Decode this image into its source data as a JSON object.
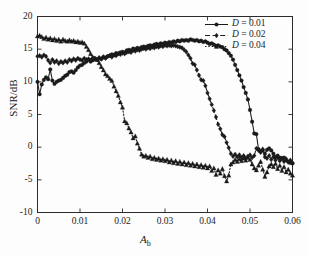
{
  "chart_data": {
    "type": "line",
    "title": "",
    "xlabel": "A_b",
    "xlabel_main": "A",
    "xlabel_sub": "b",
    "ylabel": "SNR/dB",
    "xlim": [
      0,
      0.06
    ],
    "ylim": [
      -10,
      20
    ],
    "xticks": [
      "0",
      "0.01",
      "0.02",
      "0.03",
      "0.04",
      "0.05",
      "0.06"
    ],
    "xtick_values": [
      0,
      0.01,
      0.02,
      0.03,
      0.04,
      0.05,
      0.06
    ],
    "yticks": [
      "20",
      "15",
      "10",
      "5",
      "0",
      "-5",
      "-10"
    ],
    "ytick_values": [
      20,
      15,
      10,
      5,
      0,
      -5,
      -10
    ],
    "grid": false,
    "legend_position": "top-right",
    "legend": [
      "D = 0.01",
      "D = 0.02",
      "D = 0.04"
    ],
    "series": [
      {
        "name": "D = 0.01",
        "label_var": "D",
        "label_eq": " = 0.01",
        "color": "#1a1a1a",
        "linestyle": "solid",
        "marker": "circle",
        "x": [
          0.0,
          0.0005,
          0.001,
          0.0015,
          0.002,
          0.0025,
          0.003,
          0.0035,
          0.004,
          0.0045,
          0.005,
          0.0055,
          0.006,
          0.0065,
          0.007,
          0.0075,
          0.008,
          0.0085,
          0.009,
          0.0095,
          0.01,
          0.0105,
          0.011,
          0.0115,
          0.012,
          0.0125,
          0.013,
          0.0135,
          0.014,
          0.0145,
          0.015,
          0.0155,
          0.016,
          0.0165,
          0.017,
          0.0175,
          0.018,
          0.0185,
          0.019,
          0.0195,
          0.02,
          0.0205,
          0.021,
          0.0215,
          0.022,
          0.0225,
          0.023,
          0.0235,
          0.024,
          0.0245,
          0.025,
          0.0255,
          0.026,
          0.0265,
          0.027,
          0.0275,
          0.028,
          0.0285,
          0.029,
          0.0295,
          0.03,
          0.0305,
          0.031,
          0.0315,
          0.032,
          0.0325,
          0.033,
          0.0335,
          0.034,
          0.0345,
          0.035,
          0.0355,
          0.036,
          0.0365,
          0.037,
          0.0375,
          0.038,
          0.0385,
          0.039,
          0.0395,
          0.04,
          0.0405,
          0.041,
          0.0415,
          0.042,
          0.0425,
          0.043,
          0.0435,
          0.044,
          0.0445,
          0.045,
          0.0455,
          0.046,
          0.0465,
          0.047,
          0.0475,
          0.048,
          0.0485,
          0.049,
          0.0495,
          0.05,
          0.0505,
          0.051,
          0.0515,
          0.052,
          0.0525,
          0.053,
          0.0535,
          0.054,
          0.0545,
          0.055,
          0.0555,
          0.056,
          0.0565,
          0.057,
          0.0575,
          0.058,
          0.0585,
          0.059,
          0.0595,
          0.06
        ],
        "y": [
          10.0,
          8.1,
          9.6,
          10.3,
          10.7,
          10.4,
          11.9,
          10.2,
          9.7,
          10.0,
          10.2,
          10.3,
          10.6,
          10.9,
          11.1,
          11.5,
          11.6,
          11.4,
          11.8,
          12.2,
          12.5,
          12.6,
          12.9,
          13.1,
          13.4,
          13.1,
          13.3,
          13.6,
          13.4,
          13.6,
          13.5,
          13.8,
          13.7,
          13.9,
          14.0,
          14.2,
          14.1,
          14.4,
          14.3,
          14.5,
          14.6,
          14.5,
          14.8,
          14.9,
          14.8,
          15.1,
          15.0,
          15.2,
          15.1,
          15.3,
          15.4,
          15.3,
          15.5,
          15.6,
          15.5,
          15.7,
          15.8,
          15.7,
          15.9,
          15.8,
          16.0,
          15.9,
          16.1,
          16.0,
          16.2,
          16.1,
          16.3,
          16.2,
          16.4,
          16.3,
          16.4,
          16.3,
          16.5,
          16.4,
          16.3,
          16.4,
          16.2,
          16.3,
          16.1,
          16.2,
          16.0,
          15.8,
          15.9,
          15.7,
          15.5,
          15.6,
          15.4,
          15.3,
          15.0,
          14.8,
          14.4,
          14.0,
          13.4,
          12.6,
          11.8,
          11.0,
          10.2,
          9.2,
          8.3,
          7.3,
          5.7,
          3.9,
          2.1,
          2.0,
          -0.3,
          -0.6,
          -0.5,
          -1.0,
          -0.4,
          -0.2,
          -0.5,
          -1.0,
          -1.5,
          -1.3,
          -1.6,
          -1.8,
          -1.6,
          -2.0,
          -2.2,
          -2.4,
          -2.5
        ]
      },
      {
        "name": "D = 0.02",
        "label_var": "D",
        "label_eq": " = 0.02",
        "color": "#1a1a1a",
        "linestyle": "dashed",
        "marker": "diamond",
        "x": [
          0.0,
          0.0005,
          0.001,
          0.0015,
          0.002,
          0.0025,
          0.003,
          0.0035,
          0.004,
          0.0045,
          0.005,
          0.0055,
          0.006,
          0.0065,
          0.007,
          0.0075,
          0.008,
          0.0085,
          0.009,
          0.0095,
          0.01,
          0.0105,
          0.011,
          0.0115,
          0.012,
          0.0125,
          0.013,
          0.0135,
          0.014,
          0.0145,
          0.015,
          0.0155,
          0.016,
          0.0165,
          0.017,
          0.0175,
          0.018,
          0.0185,
          0.019,
          0.0195,
          0.02,
          0.0205,
          0.021,
          0.0215,
          0.022,
          0.0225,
          0.023,
          0.0235,
          0.024,
          0.0245,
          0.025,
          0.0255,
          0.026,
          0.0265,
          0.027,
          0.0275,
          0.028,
          0.0285,
          0.029,
          0.0295,
          0.03,
          0.0305,
          0.031,
          0.0315,
          0.032,
          0.0325,
          0.033,
          0.0335,
          0.034,
          0.0345,
          0.035,
          0.0355,
          0.036,
          0.0365,
          0.037,
          0.0375,
          0.038,
          0.0385,
          0.039,
          0.0395,
          0.04,
          0.0405,
          0.041,
          0.0415,
          0.042,
          0.0425,
          0.043,
          0.0435,
          0.044,
          0.0445,
          0.045,
          0.0455,
          0.046,
          0.0465,
          0.047,
          0.0475,
          0.048,
          0.0485,
          0.049,
          0.0495,
          0.05,
          0.0505,
          0.051,
          0.0515,
          0.052,
          0.0525,
          0.053,
          0.0535,
          0.054,
          0.0545,
          0.055,
          0.0555,
          0.056,
          0.0565,
          0.057,
          0.0575,
          0.058,
          0.0585,
          0.059,
          0.0595,
          0.06
        ],
        "y": [
          13.9,
          14.0,
          13.8,
          14.1,
          13.9,
          13.3,
          12.9,
          13.4,
          13.0,
          13.2,
          12.8,
          13.1,
          12.9,
          13.2,
          13.0,
          13.4,
          13.2,
          13.5,
          13.3,
          13.6,
          13.4,
          13.3,
          13.6,
          13.4,
          13.5,
          13.3,
          13.6,
          13.5,
          13.4,
          13.7,
          13.5,
          13.8,
          13.6,
          13.9,
          14.0,
          13.8,
          14.1,
          14.0,
          14.3,
          14.2,
          14.4,
          14.3,
          14.5,
          14.6,
          14.5,
          14.8,
          14.7,
          14.9,
          14.8,
          15.0,
          15.1,
          15.0,
          15.2,
          15.1,
          15.3,
          15.2,
          15.4,
          15.3,
          15.5,
          15.4,
          15.6,
          15.5,
          15.6,
          15.5,
          15.6,
          15.5,
          15.4,
          15.3,
          15.2,
          14.9,
          14.6,
          14.1,
          13.6,
          12.8,
          12.6,
          11.8,
          11.0,
          10.3,
          10.2,
          9.4,
          8.3,
          7.4,
          6.5,
          5.6,
          4.6,
          3.5,
          2.8,
          1.9,
          1.6,
          0.7,
          -0.1,
          -1.0,
          -1.4,
          -1.1,
          -1.5,
          -1.2,
          -1.6,
          -1.3,
          -1.7,
          -1.4,
          -1.2,
          -1.6,
          -1.3,
          -0.2,
          -0.5,
          -0.8,
          -0.3,
          -1.5,
          -1.7,
          -1.3,
          -1.9,
          -1.5,
          -2.0,
          -1.6,
          -2.1,
          -1.7,
          -2.2,
          -1.8,
          -2.3,
          -2.0,
          -2.4
        ]
      },
      {
        "name": "D = 0.04",
        "label_var": "D",
        "label_eq": " = 0.04",
        "color": "#1a1a1a",
        "linestyle": "dotted",
        "marker": "triangle",
        "x": [
          0.0,
          0.0005,
          0.001,
          0.0015,
          0.002,
          0.0025,
          0.003,
          0.0035,
          0.004,
          0.0045,
          0.005,
          0.0055,
          0.006,
          0.0065,
          0.007,
          0.0075,
          0.008,
          0.0085,
          0.009,
          0.0095,
          0.01,
          0.0105,
          0.011,
          0.0115,
          0.012,
          0.0125,
          0.013,
          0.0135,
          0.014,
          0.0145,
          0.015,
          0.0155,
          0.016,
          0.0165,
          0.017,
          0.0175,
          0.018,
          0.0185,
          0.019,
          0.0195,
          0.02,
          0.0205,
          0.021,
          0.0215,
          0.022,
          0.0225,
          0.023,
          0.0235,
          0.024,
          0.0245,
          0.025,
          0.0255,
          0.026,
          0.0265,
          0.027,
          0.0275,
          0.028,
          0.0285,
          0.029,
          0.0295,
          0.03,
          0.0305,
          0.031,
          0.0315,
          0.032,
          0.0325,
          0.033,
          0.0335,
          0.034,
          0.0345,
          0.035,
          0.0355,
          0.036,
          0.0365,
          0.037,
          0.0375,
          0.038,
          0.0385,
          0.039,
          0.0395,
          0.04,
          0.0405,
          0.041,
          0.0415,
          0.042,
          0.0425,
          0.043,
          0.0435,
          0.044,
          0.0445,
          0.045,
          0.0455,
          0.046,
          0.0465,
          0.047,
          0.0475,
          0.048,
          0.0485,
          0.049,
          0.0495,
          0.05,
          0.0505,
          0.051,
          0.0515,
          0.052,
          0.0525,
          0.053,
          0.0535,
          0.054,
          0.0545,
          0.055,
          0.0555,
          0.056,
          0.0565,
          0.057,
          0.0575,
          0.058,
          0.0585,
          0.059,
          0.0595,
          0.06
        ],
        "y": [
          17.0,
          17.1,
          16.9,
          16.6,
          16.8,
          16.5,
          16.7,
          16.4,
          16.6,
          16.3,
          16.5,
          16.2,
          16.5,
          16.3,
          16.2,
          16.4,
          16.2,
          16.3,
          16.1,
          16.2,
          16.0,
          16.1,
          15.9,
          15.4,
          14.9,
          14.3,
          13.8,
          13.6,
          13.4,
          12.9,
          12.3,
          11.8,
          11.2,
          10.9,
          10.5,
          10.2,
          9.3,
          8.6,
          7.9,
          6.9,
          6.1,
          4.0,
          3.7,
          2.9,
          2.3,
          1.4,
          1.7,
          0.6,
          -0.2,
          -1.1,
          -1.4,
          -1.3,
          -1.6,
          -1.4,
          -1.8,
          -1.6,
          -1.9,
          -1.7,
          -2.0,
          -1.8,
          -2.1,
          -1.9,
          -2.3,
          -2.0,
          -2.4,
          -2.1,
          -2.5,
          -2.2,
          -2.6,
          -2.3,
          -2.7,
          -2.4,
          -2.8,
          -2.5,
          -2.9,
          -2.6,
          -3.0,
          -2.7,
          -3.1,
          -2.8,
          -3.2,
          -2.9,
          -3.6,
          -3.2,
          -4.2,
          -3.5,
          -4.0,
          -3.3,
          -4.4,
          -5.2,
          -4.3,
          -2.6,
          -2.3,
          -1.9,
          -2.2,
          -1.8,
          -2.1,
          -1.7,
          -2.0,
          -1.6,
          -1.9,
          -2.6,
          -3.2,
          -3.5,
          -2.8,
          -2.2,
          -3.4,
          -4.5,
          -3.8,
          -2.9,
          -2.6,
          -3.0,
          -2.5,
          -3.3,
          -2.8,
          -3.6,
          -3.0,
          -3.8,
          -3.4,
          -4.0,
          -4.3
        ]
      }
    ]
  }
}
